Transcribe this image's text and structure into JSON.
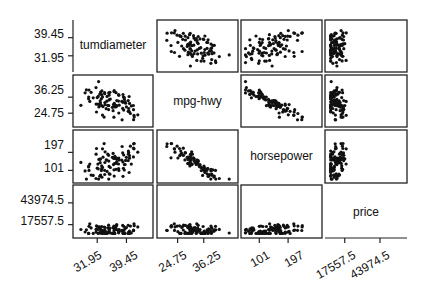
{
  "chart_data": {
    "type": "scatter-matrix",
    "title": "",
    "variables": [
      "tumdiameter",
      "mpg-hwy",
      "horsepower",
      "price"
    ],
    "ticks": {
      "tumdiameter": [
        "31.95",
        "39.45"
      ],
      "mpg-hwy": [
        "24.75",
        "36.25"
      ],
      "horsepower": [
        "101",
        "197"
      ],
      "price": [
        "17557.5",
        "43974.5"
      ]
    },
    "tick_values": {
      "tumdiameter": [
        31.95,
        39.45
      ],
      "mpg-hwy": [
        24.75,
        36.25
      ],
      "horsepower": [
        101,
        197
      ],
      "price": [
        17557.5,
        43974.5
      ]
    },
    "ranges": {
      "tumdiameter": [
        26.5,
        45.5
      ],
      "mpg-hwy": [
        17,
        50
      ],
      "horsepower": [
        50,
        300
      ],
      "price": [
        5000,
        62000
      ]
    },
    "relationships": {
      "tumdiameter~mpg-hwy": "negative, weak",
      "tumdiameter~horsepower": "positive, moderate",
      "tumdiameter~price": "positive, moderate",
      "mpg-hwy~horsepower": "negative, strong",
      "mpg-hwy~price": "negative, curved",
      "horsepower~price": "positive, strong"
    },
    "n_points": 93,
    "grid": false,
    "legend": "none"
  },
  "diagonal_labels": [
    "tumdiameter",
    "mpg-hwy",
    "horsepower",
    "price"
  ],
  "axis": {
    "left": [
      {
        "row": 0,
        "ticks": [
          "39.45",
          "31.95"
        ]
      },
      {
        "row": 1,
        "ticks": [
          "36.25",
          "24.75"
        ]
      },
      {
        "row": 2,
        "ticks": [
          "197",
          "101"
        ]
      },
      {
        "row": 3,
        "ticks": [
          "43974.5",
          "17557.5"
        ]
      }
    ],
    "bottom": [
      {
        "col": 0,
        "ticks": [
          "31.95",
          "39.45"
        ]
      },
      {
        "col": 1,
        "ticks": [
          "24.75",
          "36.25"
        ]
      },
      {
        "col": 2,
        "ticks": [
          "101",
          "197"
        ]
      },
      {
        "col": 3,
        "ticks": [
          "17557.5",
          "43974.5"
        ]
      }
    ]
  }
}
